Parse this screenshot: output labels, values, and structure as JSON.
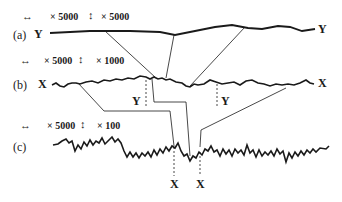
{
  "panels": [
    {
      "id": "a",
      "label": "(a)",
      "left_end": "Y",
      "right_end": "Y",
      "horizontal_scale": "× 5000",
      "vertical_scale": "× 5000"
    },
    {
      "id": "b",
      "label": "(b)",
      "left_end": "X",
      "right_end": "X",
      "horizontal_scale": "× 5000",
      "vertical_scale": "× 1000",
      "markers": [
        "Y",
        "Y"
      ]
    },
    {
      "id": "c",
      "label": "(c)",
      "horizontal_scale": "× 5000",
      "vertical_scale": "× 100",
      "markers": [
        "X",
        "X"
      ]
    }
  ],
  "icons": {
    "horizontal": "↔",
    "vertical": "↕"
  },
  "colors": {
    "ink": "#1a1a1a",
    "background": "#ffffff"
  }
}
